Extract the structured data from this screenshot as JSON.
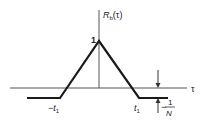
{
  "diagram": {
    "y_axis_label": "R",
    "y_axis_subscript": "b",
    "y_axis_arg": "(τ)",
    "x_axis_label": "τ",
    "peak_label": "1",
    "neg_t1_label": "−t",
    "t1_label": "t",
    "t_subscript": "1",
    "offset_label_prefix": "−",
    "offset_numerator": "1",
    "offset_denominator": "N",
    "colors": {
      "line": "#1a1a1a",
      "axis": "#555555"
    }
  }
}
